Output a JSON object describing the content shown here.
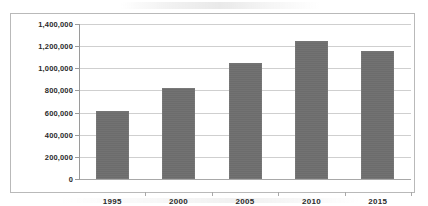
{
  "chart_data": {
    "type": "bar",
    "title": "",
    "subtitle": "",
    "xlabel": "",
    "ylabel": "",
    "categories": [
      "1995",
      "2000",
      "2005",
      "2010",
      "2015"
    ],
    "values": [
      610000,
      820000,
      1045000,
      1250000,
      1160000
    ],
    "series": [
      {
        "name": "",
        "values": [
          610000,
          820000,
          1045000,
          1250000,
          1160000
        ]
      }
    ],
    "ylim": [
      0,
      1400000
    ],
    "ytick_values": [
      0,
      200000,
      400000,
      600000,
      800000,
      1000000,
      1200000,
      1400000
    ],
    "ytick_labels": [
      "0",
      "200,000",
      "400,000",
      "600,000",
      "800,000",
      "1,000,000",
      "1,200,000",
      "1,400,000"
    ],
    "grid": true,
    "legend": false,
    "legend_position": "none",
    "bar_color": "#6e6e6e",
    "gridline_color": "#cfcfcf",
    "axis_color": "#9a9a9a",
    "frame_color": "#b9b9b9",
    "background_color": "#ffffff",
    "annotations": []
  }
}
